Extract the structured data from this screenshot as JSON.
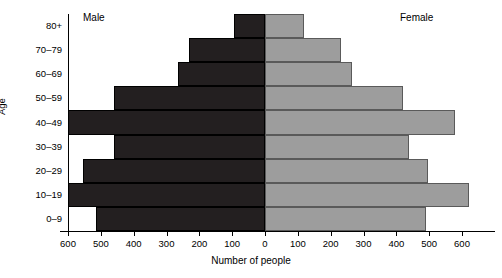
{
  "chart_data": {
    "type": "bar",
    "subtype": "population-pyramid",
    "title": "",
    "xlabel": "Number of people",
    "ylabel": "Age",
    "categories": [
      "0–9",
      "10–19",
      "20–29",
      "30–39",
      "40–49",
      "50–59",
      "60–69",
      "70–79",
      "80+"
    ],
    "series": [
      {
        "name": "Male",
        "color": "#231f20",
        "values": [
          515,
          600,
          555,
          460,
          600,
          460,
          265,
          230,
          95
        ]
      },
      {
        "name": "Female",
        "color": "#9d9d9d",
        "values": [
          490,
          620,
          495,
          440,
          580,
          420,
          265,
          230,
          120
        ]
      }
    ],
    "xtick_labels": [
      "600",
      "500",
      "400",
      "300",
      "200",
      "100",
      "0",
      "100",
      "200",
      "300",
      "400",
      "500",
      "600"
    ],
    "xtick_values": [
      -600,
      -500,
      -400,
      -300,
      -200,
      -100,
      0,
      100,
      200,
      300,
      400,
      500,
      600
    ],
    "xlim": [
      -600,
      600
    ],
    "grid": false,
    "legend": "inline-top-labels"
  },
  "annotations": {
    "male_label": "Male",
    "female_label": "Female"
  },
  "axis": {
    "x_title": "Number of people",
    "y_title": "Age"
  }
}
